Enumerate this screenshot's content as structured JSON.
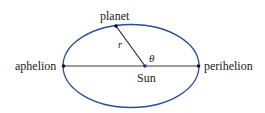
{
  "labels": {
    "planet": "planet",
    "r": "r",
    "theta": "θ",
    "sun": "Sun",
    "aphelion": "aphelion",
    "perihelion": "perihelion"
  },
  "colors": {
    "orbit": "#2b4c9a",
    "line": "#222222",
    "text": "#1a1a1a"
  }
}
